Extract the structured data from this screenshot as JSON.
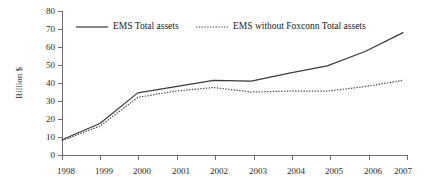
{
  "chart_data": {
    "type": "line",
    "title": "",
    "xlabel": "",
    "ylabel": "Billion $",
    "x": [
      "1998",
      "1999",
      "2000",
      "2001",
      "2002",
      "2003",
      "2004",
      "2005",
      "2006",
      "2007"
    ],
    "xlim": [
      1998,
      2007
    ],
    "ylim": [
      0,
      80
    ],
    "y_ticks": [
      0,
      10,
      20,
      30,
      40,
      50,
      60,
      70,
      80
    ],
    "x_ticks": [
      "1998",
      "1999",
      "2000",
      "2001",
      "2002",
      "2003",
      "2004",
      "2005",
      "2006",
      "2007"
    ],
    "grid": false,
    "legend_position": "top-inside",
    "series": [
      {
        "name": "EMS Total assets",
        "style": "solid",
        "color": "#3a3a3a",
        "values": [
          8.5,
          17.5,
          34.5,
          38.0,
          41.5,
          41.0,
          45.5,
          49.5,
          57.5,
          68.0
        ]
      },
      {
        "name": "EMS without Foxconn Total assets",
        "style": "dotted",
        "color": "#4a4a4a",
        "values": [
          8.0,
          16.0,
          32.0,
          35.5,
          37.5,
          35.0,
          35.5,
          35.5,
          38.0,
          41.5
        ]
      }
    ]
  },
  "axes": {
    "y_label": "Billion $",
    "y_tick_labels": [
      "80",
      "70",
      "60",
      "50",
      "40",
      "30",
      "20",
      "10",
      "0"
    ],
    "x_tick_labels": [
      "1998",
      "1999",
      "2000",
      "2001",
      "2002",
      "2003",
      "2004",
      "2005",
      "2006",
      "2007"
    ]
  },
  "legend": {
    "entries": [
      {
        "label": "EMS Total assets",
        "style": "solid"
      },
      {
        "label": "EMS without Foxconn Total assets",
        "style": "dotted"
      }
    ]
  }
}
